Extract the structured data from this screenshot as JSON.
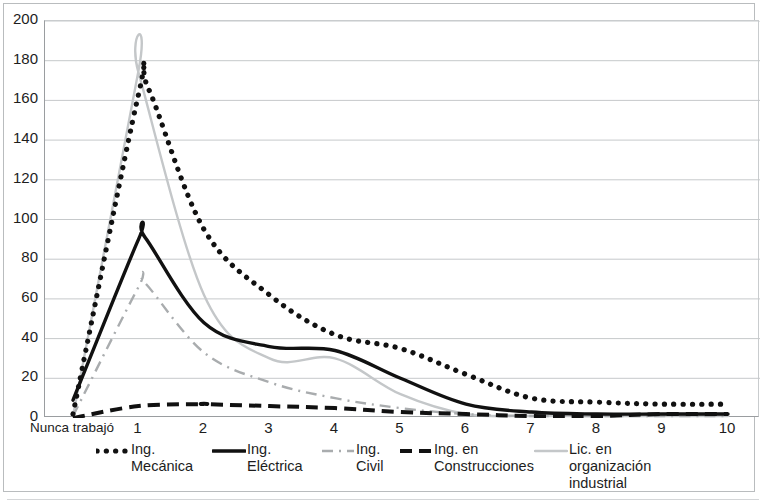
{
  "chart_data": {
    "type": "line",
    "title": "",
    "xlabel": "",
    "ylabel": "",
    "ylim": [
      0,
      200
    ],
    "ytick_labels": [
      "0",
      "20",
      "40",
      "60",
      "80",
      "100",
      "120",
      "140",
      "160",
      "180",
      "200"
    ],
    "yticks": [
      0,
      20,
      40,
      60,
      80,
      100,
      120,
      140,
      160,
      180,
      200
    ],
    "grid": "horizontal",
    "legend_position": "bottom",
    "categories": [
      "Nunca trabajó",
      "1",
      "2",
      "3",
      "4",
      "5",
      "6",
      "7",
      "8",
      "9",
      "10"
    ],
    "series": [
      {
        "name": "Ing. Mecánica",
        "style": "dotted",
        "color": "#111111",
        "values": [
          2,
          163,
          95,
          62,
          42,
          35,
          22,
          10,
          8,
          7,
          7
        ],
        "peak_value": 166,
        "peak_x": 1.15
      },
      {
        "name": "Ing. Eléctrica",
        "style": "solid-bold",
        "color": "#111111",
        "values": [
          9,
          90,
          48,
          36,
          34,
          20,
          7,
          3,
          2,
          2,
          2
        ],
        "peak_value": 91,
        "peak_x": 1.1
      },
      {
        "name": "Ing. Civil",
        "style": "dash-dot",
        "color": "#a9acae",
        "values": [
          1,
          66,
          33,
          18,
          10,
          5,
          2,
          1,
          1,
          1,
          1
        ],
        "peak_value": 68,
        "peak_x": 1.1
      },
      {
        "name": "Ing. en Construcciones",
        "style": "dashed-bold",
        "color": "#111111",
        "values": [
          0,
          6,
          7,
          6,
          5,
          3,
          2,
          1,
          1,
          2,
          2
        ],
        "peak_value": 7,
        "peak_x": 2.0
      },
      {
        "name": "Lic. en organización industrial",
        "style": "solid-light",
        "color": "#c4c7c9",
        "values": [
          1,
          174,
          62,
          30,
          30,
          12,
          2,
          1,
          1,
          1,
          1
        ],
        "peak_value": 175,
        "peak_x": 1.0
      }
    ]
  },
  "legend": {
    "items": [
      {
        "label": "Ing.\nMecánica",
        "key": "dotted-line-key"
      },
      {
        "label": "Ing.\nEléctrica",
        "key": "solid-line-key"
      },
      {
        "label": "Ing.\nCivil",
        "key": "dash-dot-line-key"
      },
      {
        "label": "Ing. en\nConstrucciones",
        "key": "dashed-line-key"
      },
      {
        "label": "Lic. en\norganización\nindustrial",
        "key": "light-solid-line-key"
      }
    ]
  }
}
